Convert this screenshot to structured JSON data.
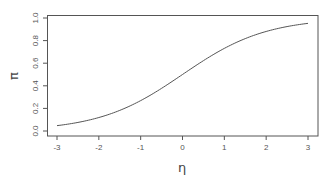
{
  "chart_data": {
    "type": "line",
    "title": "",
    "xlabel": "η",
    "ylabel": "π",
    "xlim": [
      -3,
      3
    ],
    "ylim": [
      0,
      1
    ],
    "grid": false,
    "legend": null,
    "x_ticks": [
      -3,
      -2,
      -1,
      0,
      1,
      2,
      3
    ],
    "x_tick_labels": [
      "-3",
      "-2",
      "-1",
      "0",
      "1",
      "2",
      "3"
    ],
    "y_ticks": [
      0.0,
      0.2,
      0.4,
      0.6,
      0.8,
      1.0
    ],
    "y_tick_labels": [
      "0.0",
      "0.2",
      "0.4",
      "0.6",
      "0.8",
      "1.0"
    ],
    "function": "logistic: π = 1 / (1 + exp(-η))",
    "series": [
      {
        "name": "logistic",
        "x": [
          -3,
          -2.5,
          -2,
          -1.5,
          -1,
          -0.5,
          0,
          0.5,
          1,
          1.5,
          2,
          2.5,
          3
        ],
        "values": [
          0.047,
          0.076,
          0.119,
          0.182,
          0.269,
          0.378,
          0.5,
          0.622,
          0.731,
          0.818,
          0.881,
          0.924,
          0.953
        ]
      }
    ],
    "colors": {
      "line": "#555555",
      "axis": "#555555",
      "background": "#ffffff"
    }
  }
}
